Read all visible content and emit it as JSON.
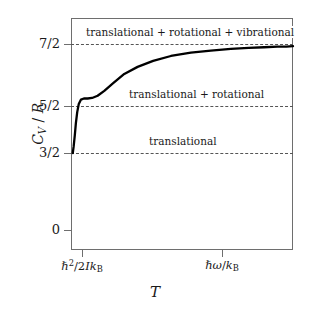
{
  "chart_data": {
    "type": "line",
    "title": "",
    "xlabel": "T",
    "ylabel": "C_V / R",
    "ylim": [
      0,
      4
    ],
    "xlim": [
      0,
      1
    ],
    "grid": false,
    "legend_position": "none",
    "ytick_values": [
      3.5,
      2.5,
      1.5,
      0
    ],
    "ytick_labels": [
      "7/2",
      "5/2",
      "3/2",
      "0"
    ],
    "xtick_labels": [
      "h-bar^2/2Ik_B",
      "h-bar*omega/k_B"
    ],
    "xtick_positions": [
      0.05,
      0.68
    ],
    "reference_lines": [
      {
        "y": 3.5,
        "label": "translational + rotational + vibrational",
        "style": "dashed"
      },
      {
        "y": 2.5,
        "label": "translational + rotational",
        "style": "dashed"
      },
      {
        "y": 1.5,
        "label": "translational",
        "style": "dashed"
      }
    ],
    "series": [
      {
        "name": "heat capacity",
        "x": [
          0.008,
          0.012,
          0.017,
          0.022,
          0.028,
          0.035,
          0.045,
          0.058,
          0.075,
          0.095,
          0.12,
          0.15,
          0.19,
          0.24,
          0.3,
          0.37,
          0.45,
          0.54,
          0.63,
          0.72,
          0.8,
          0.87,
          0.93,
          0.97,
          1.0
        ],
        "y": [
          1.5,
          1.62,
          1.82,
          2.05,
          2.25,
          2.4,
          2.48,
          2.5,
          2.5,
          2.51,
          2.55,
          2.64,
          2.78,
          2.95,
          3.08,
          3.19,
          3.28,
          3.34,
          3.38,
          3.41,
          3.43,
          3.44,
          3.45,
          3.45,
          3.46
        ]
      }
    ]
  },
  "axes": {
    "yticks": [
      {
        "label_num": "7",
        "label_den": "2",
        "text": "7/2"
      },
      {
        "label_num": "5",
        "label_den": "2",
        "text": "5/2"
      },
      {
        "label_num": "3",
        "label_den": "2",
        "text": "3/2"
      },
      {
        "text": "0"
      }
    ],
    "y_title": "CV / R",
    "x_title": "T"
  },
  "annotations": {
    "top": "translational + rotational + vibrational",
    "middle": "translational + rotational",
    "bottom": "translational"
  },
  "colors": {
    "curve": "#000000",
    "frame": "#6e6e6e",
    "dashed": "#555555",
    "background": "#ffffff"
  }
}
